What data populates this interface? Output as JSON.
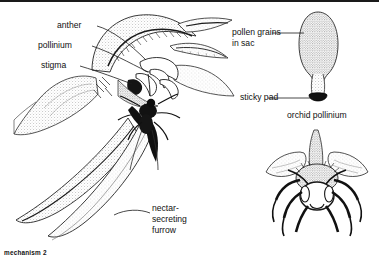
{
  "figure": {
    "caption": "mechanism 2"
  },
  "labels": {
    "anther": "anther",
    "pollinium": "pollinium",
    "stigma": "stigma",
    "nectar_furrow_line1": "nectar-",
    "nectar_furrow_line2": "secreting",
    "nectar_furrow_line3": "furrow",
    "pollen_grains_line1": "pollen grains",
    "pollen_grains_line2": "in sac",
    "sticky_pad": "sticky pad",
    "orchid_pollinium_caption": "orchid pollinium"
  },
  "colors": {
    "ink": "#111111",
    "background": "#ffffff",
    "stipple": "#6b6b6b",
    "dark_fill": "#111111"
  },
  "parts": {
    "flower": "orchid flower side view",
    "insect_in_flower": "insect entering flower",
    "pollinium_detail": "isolated orchid pollinium",
    "bee_front": "frontal view of bee"
  }
}
